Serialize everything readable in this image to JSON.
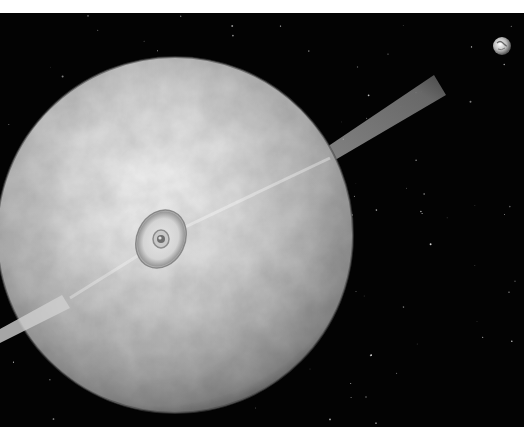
{
  "image": {
    "alt": "Rendered scene of a large pale asteroid-like sphere pierced by a light beam, with a small Earth in the upper right against a starfield",
    "background_color": "#030303",
    "border_color": "#ffffff"
  },
  "scene": {
    "sphere": {
      "label": "pale cratered sphere",
      "cx": 175,
      "cy": 222,
      "r": 178,
      "color_highlight": "#f2f2f2",
      "color_mid": "#bdbdbd",
      "color_shadow": "#6a6a6a"
    },
    "beam": {
      "label": "light beam jet",
      "color": "#8a8a8a"
    },
    "impact_ring": {
      "label": "ringed impact structure",
      "cx": 161,
      "cy": 226,
      "rx": 24,
      "ry": 30
    },
    "earth": {
      "label": "small Earth",
      "cx": 502,
      "cy": 33,
      "r": 9
    },
    "stars_count": 120
  }
}
